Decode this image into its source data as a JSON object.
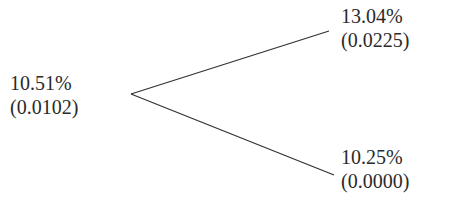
{
  "tree": {
    "root": {
      "rate": "10.51%",
      "value": "(0.0102)"
    },
    "up": {
      "rate": "13.04%",
      "value": "(0.0225)"
    },
    "down": {
      "rate": "10.25%",
      "value": "(0.0000)"
    }
  },
  "colors": {
    "line": "#333333",
    "text": "#2a2a2a",
    "background": "#ffffff"
  }
}
